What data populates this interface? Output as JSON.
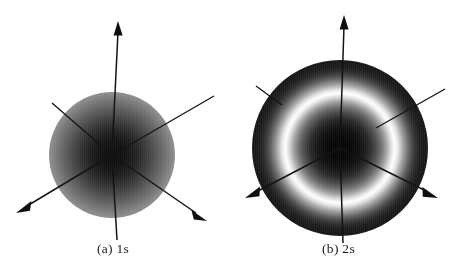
{
  "figure": {
    "background_color": "#ffffff",
    "ink_color": "#141414",
    "width": 451,
    "height": 278
  },
  "panels": [
    {
      "id": "panel-a",
      "caption": "(a) 1s",
      "orbital_label": "1s",
      "part_label": "(a)",
      "cloud": {
        "name": "1s-orbital-cloud",
        "center_x": 112,
        "center_y": 155,
        "radius": 63,
        "description": "solid sphere, dense dark core fading to white at rim",
        "core_color": "#0d0d0d",
        "rim_color": "#ffffff",
        "nodes": 0
      },
      "axes": [
        {
          "name": "axis-z-up",
          "arrowhead": true,
          "x1": 112,
          "y1": 155,
          "x2": 118,
          "y2": 22
        },
        {
          "name": "axis-z-down",
          "arrowhead": false,
          "x1": 112,
          "y1": 155,
          "x2": 117,
          "y2": 240
        },
        {
          "name": "axis-y-upper-right",
          "arrowhead": false,
          "x1": 112,
          "y1": 155,
          "x2": 214,
          "y2": 96
        },
        {
          "name": "axis-y-lower-left",
          "arrowhead": true,
          "x1": 112,
          "y1": 155,
          "x2": 17,
          "y2": 212
        },
        {
          "name": "axis-x-upper-left",
          "arrowhead": false,
          "x1": 112,
          "y1": 155,
          "x2": 52,
          "y2": 103
        },
        {
          "name": "axis-x-lower-right",
          "arrowhead": true,
          "x1": 112,
          "y1": 155,
          "x2": 207,
          "y2": 221
        }
      ]
    },
    {
      "id": "panel-b",
      "caption": "(b) 2s",
      "orbital_label": "2s",
      "part_label": "(b)",
      "cloud": {
        "name": "2s-orbital-cloud",
        "center_x": 114,
        "center_y": 148,
        "radius": 88,
        "description": "dark inner core, bright white spherical node ring, dark outer shell fading at rim",
        "core_color": "#050505",
        "node_ring_color": "#fdfdfd",
        "node_ring_radius": 39,
        "outer_shell_color": "#161616",
        "rim_color": "#ffffff",
        "nodes": 1
      },
      "axes": [
        {
          "name": "axis-z-up",
          "arrowhead": true,
          "x1": 114,
          "y1": 148,
          "x2": 118,
          "y2": 16
        },
        {
          "name": "axis-z-down",
          "arrowhead": false,
          "x1": 114,
          "y1": 148,
          "x2": 117,
          "y2": 243
        },
        {
          "name": "axis-y-upper-right",
          "arrowhead": false,
          "x1": 114,
          "y1": 148,
          "x2": 219,
          "y2": 89
        },
        {
          "name": "axis-y-lower-left",
          "arrowhead": true,
          "x1": 114,
          "y1": 148,
          "x2": 19,
          "y2": 197
        },
        {
          "name": "axis-x-upper-left",
          "arrowhead": false,
          "x1": 114,
          "y1": 148,
          "x2": 30,
          "y2": 86
        },
        {
          "name": "axis-x-lower-right",
          "arrowhead": true,
          "x1": 114,
          "y1": 148,
          "x2": 211,
          "y2": 197
        }
      ]
    }
  ],
  "caption_style": {
    "a_y": 249,
    "b_y": 249
  }
}
